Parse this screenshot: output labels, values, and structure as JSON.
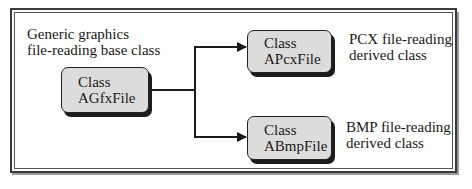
{
  "diagram": {
    "base": {
      "caption_lines": [
        "Generic graphics",
        "file-reading base class"
      ],
      "box_lines": [
        "Class",
        "AGfxFile"
      ]
    },
    "derived": [
      {
        "box_lines": [
          "Class",
          "APcxFile"
        ],
        "caption_lines": [
          "PCX file-reading",
          "derived class"
        ]
      },
      {
        "box_lines": [
          "Class",
          "ABmpFile"
        ],
        "caption_lines": [
          "BMP file-reading",
          "derived class"
        ]
      }
    ],
    "colors": {
      "box_fill": "#dcdcdc",
      "line": "#1a1a1a",
      "shadow": "#1c1c1c",
      "background": "#ffffff"
    },
    "edges": [
      {
        "from": "AGfxFile",
        "to": "APcxFile"
      },
      {
        "from": "AGfxFile",
        "to": "ABmpFile"
      }
    ]
  }
}
